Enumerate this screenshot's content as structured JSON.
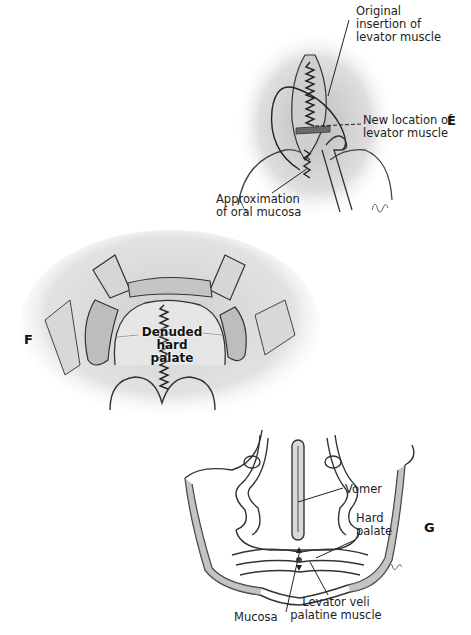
{
  "panels": {
    "E": {
      "letter": "E",
      "labels": {
        "original_insertion": [
          "Original",
          "insertion of",
          "levator muscle"
        ],
        "new_location": [
          "New location of",
          "levator muscle"
        ],
        "approximation": [
          "Approximation",
          "of oral mucosa"
        ]
      },
      "signature": "L.L."
    },
    "F": {
      "letter": "F",
      "labels": {
        "denuded": [
          "Denuded",
          "hard palate"
        ]
      }
    },
    "G": {
      "letter": "G",
      "labels": {
        "vomer": "Vomer",
        "hard_palate": [
          "Hard",
          "palate"
        ],
        "mucosa": "Mucosa",
        "levator": [
          "Levator veli",
          "palatine muscle"
        ]
      },
      "signature": "L.A."
    }
  },
  "colors": {
    "ink": "#2a2a2a",
    "shade": "#9a9a9a",
    "light_shade": "#d4d4d4",
    "background": "#ffffff"
  }
}
